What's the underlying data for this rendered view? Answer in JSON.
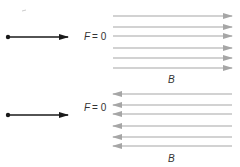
{
  "diagram": {
    "panels": [
      {
        "name": "parallel",
        "particle_direction": "right",
        "force_label_var": "F",
        "force_label_eq": "= 0",
        "field_direction": "right",
        "field_label": "B",
        "field_line_ys": [
          16,
          27,
          36,
          48,
          58,
          68
        ],
        "particle_y": 37,
        "label_y": 40,
        "field_label_y": 83
      },
      {
        "name": "antiparallel",
        "particle_direction": "right",
        "force_label_var": "F",
        "force_label_eq": "= 0",
        "field_direction": "left",
        "field_label": "B",
        "field_line_ys": [
          94,
          105,
          114,
          126,
          137,
          146
        ],
        "particle_y": 115,
        "label_y": 111,
        "field_label_y": 162
      }
    ],
    "colors": {
      "particle": "#1a1a1a",
      "field_lines": "#a6a6a6",
      "text": "#333333"
    }
  }
}
